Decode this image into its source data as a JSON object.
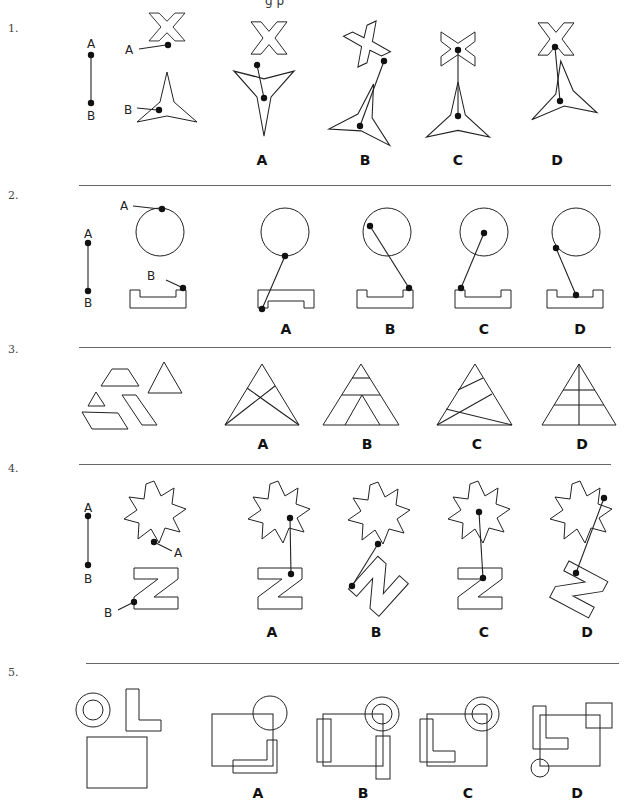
{
  "page": {
    "header_fragment": "g p"
  },
  "questions": [
    {
      "number": "1.",
      "options": [
        "A",
        "B",
        "C",
        "D"
      ],
      "point_labels": [
        "A",
        "B"
      ],
      "shapes": [
        "x-shape",
        "three-point-star"
      ]
    },
    {
      "number": "2.",
      "options": [
        "A",
        "B",
        "C",
        "D"
      ],
      "point_labels": [
        "A",
        "B"
      ],
      "shapes": [
        "circle",
        "u-channel"
      ]
    },
    {
      "number": "3.",
      "options": [
        "A",
        "B",
        "C",
        "D"
      ],
      "shapes": [
        "trapezoid",
        "triangle-large",
        "triangle-small",
        "parallelogram-1",
        "parallelogram-2"
      ]
    },
    {
      "number": "4.",
      "options": [
        "A",
        "B",
        "C",
        "D"
      ],
      "point_labels": [
        "A",
        "B"
      ],
      "shapes": [
        "nine-point-star",
        "z-shape"
      ]
    },
    {
      "number": "5.",
      "options": [
        "A",
        "B",
        "C",
        "D"
      ],
      "shapes": [
        "double-circle",
        "l-shape",
        "square"
      ]
    }
  ]
}
